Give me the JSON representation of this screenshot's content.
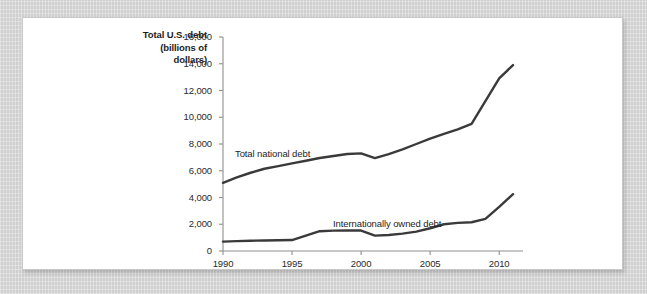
{
  "figure": {
    "background_color": "#d6d6d6",
    "card_color": "#ffffff",
    "line_color": "#3a3a3a",
    "axis_color": "#8f8f8f",
    "text_color": "#1d1d1d"
  },
  "axis_title": {
    "line1": "Total U.S. debt",
    "line2": "(billions of",
    "line3": "dollars)"
  },
  "chart_data": {
    "type": "line",
    "title": "",
    "subtitle": "",
    "xlabel": "",
    "ylabel": "Total U.S. debt (billions of dollars)",
    "xlim": [
      1990,
      2011
    ],
    "ylim": [
      0,
      16000
    ],
    "grid": false,
    "legend": "inline-annotations",
    "xticks": [
      1990,
      1995,
      2000,
      2005,
      2010
    ],
    "xtick_labels": [
      "1990",
      "1995",
      "2000",
      "2005",
      "2010"
    ],
    "yticks": [
      0,
      2000,
      4000,
      6000,
      8000,
      10000,
      12000,
      14000,
      16000
    ],
    "ytick_labels": [
      "0",
      "2,000",
      "4,000",
      "6,000",
      "8,000",
      "10,000",
      "12,000",
      "14,000",
      "16,000"
    ],
    "x": [
      1990,
      1991,
      1992,
      1993,
      1994,
      1995,
      1996,
      1997,
      1998,
      1999,
      2000,
      2001,
      2002,
      2003,
      2004,
      2005,
      2006,
      2007,
      2008,
      2009,
      2010,
      2011
    ],
    "series": [
      {
        "name": "Total national debt",
        "label": "Total national debt",
        "color": "#3a3a3a",
        "values": [
          5100,
          5500,
          5850,
          6150,
          6350,
          6550,
          6750,
          6950,
          7100,
          7250,
          7300,
          6950,
          7250,
          7600,
          8000,
          8400,
          8750,
          9100,
          9500,
          11200,
          12900,
          13900
        ]
      },
      {
        "name": "Internationally owned debt",
        "label": "Internationally owned debt",
        "color": "#3a3a3a",
        "values": [
          700,
          740,
          770,
          790,
          800,
          820,
          1150,
          1480,
          1520,
          1530,
          1530,
          1150,
          1200,
          1300,
          1450,
          1700,
          2000,
          2100,
          2150,
          2400,
          3300,
          4250
        ]
      }
    ]
  }
}
